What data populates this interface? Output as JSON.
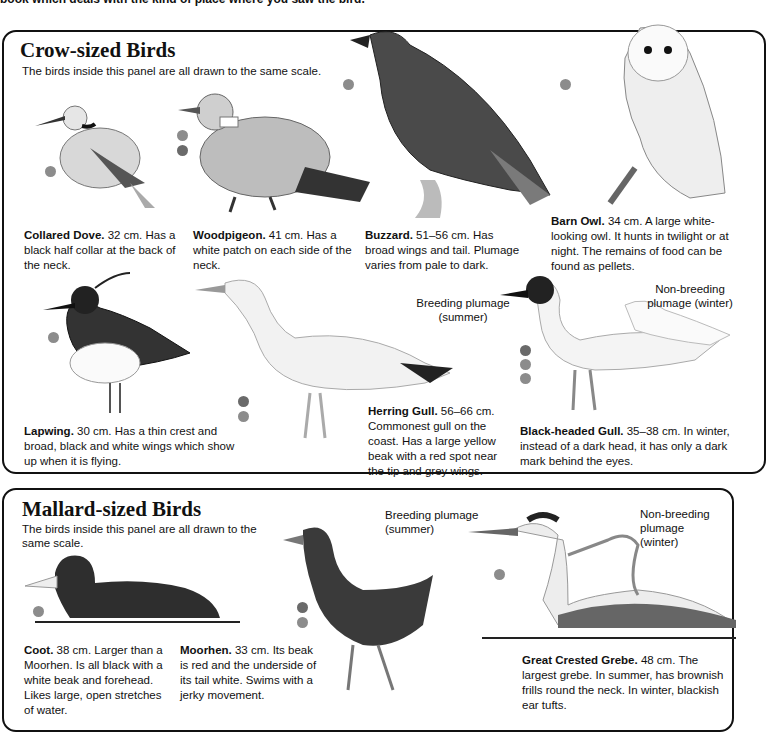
{
  "intro_text": "book which deals with the kind of place where you saw the bird.",
  "colors": {
    "dot_dark": "#6a6a6a",
    "dot_light": "#8c8c8c",
    "ink": "#111111"
  },
  "crow_panel": {
    "title": "Crow-sized Birds",
    "subtitle": "The birds inside this panel are all drawn to the same scale.",
    "birds": [
      {
        "name": "Collared Dove.",
        "desc": " 32 cm. Has a black half collar at the back of the neck."
      },
      {
        "name": "Woodpigeon.",
        "desc": " 41 cm. Has a white patch on each side of the neck."
      },
      {
        "name": "Buzzard.",
        "desc": " 51–56 cm. Has broad wings and tail. Plumage varies from pale to dark."
      },
      {
        "name": "Barn Owl.",
        "desc": " 34 cm. A large white-looking owl. It hunts in twilight or at night. The remains of food can be found as pellets."
      },
      {
        "name": "Lapwing.",
        "desc": " 30 cm. Has a thin crest and broad, black and white wings which show up when it is flying."
      },
      {
        "name": "Herring Gull.",
        "desc": " 56–66 cm. Commonest gull on the coast. Has a large yellow beak with a red spot near the tip and grey wings."
      },
      {
        "name": "Black-headed Gull.",
        "desc": " 35–38 cm. In winter, instead of a dark head, it has only a dark mark behind the eyes."
      }
    ],
    "gull_labels": {
      "breeding": "Breeding plumage (summer)",
      "nonbreeding": "Non-breeding plumage (winter)"
    }
  },
  "mallard_panel": {
    "title": "Mallard-sized Birds",
    "subtitle": "The birds inside this panel are all drawn to the same scale.",
    "birds": [
      {
        "name": "Coot.",
        "desc": " 38 cm. Larger than a Moorhen. Is all black with a white beak and forehead. Likes large, open stretches of water."
      },
      {
        "name": "Moorhen.",
        "desc": " 33 cm. Its beak is red and the underside of its tail white. Swims with a jerky movement."
      },
      {
        "name": "Great Crested Grebe.",
        "desc": " 48 cm. The largest grebe. In summer, has brownish frills round the neck. In winter, blackish ear tufts."
      }
    ],
    "grebe_labels": {
      "breeding": "Breeding plumage (summer)",
      "nonbreeding": "Non-breeding plumage (winter)"
    }
  }
}
